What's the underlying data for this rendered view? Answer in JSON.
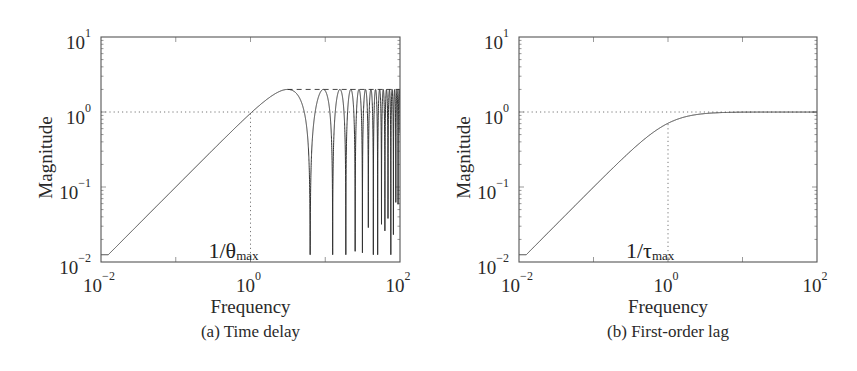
{
  "figure": {
    "width": 857,
    "height": 371,
    "line_color": "#333333",
    "frame_color": "#555555",
    "guide_color": "#777777"
  },
  "chart_data": [
    {
      "id": "a",
      "type": "line",
      "title": "",
      "caption": "(a) Time delay",
      "xlabel": "Frequency",
      "ylabel": "Magnitude",
      "xscale": "log",
      "yscale": "log",
      "xlim": [
        0.01,
        100
      ],
      "ylim": [
        0.01,
        10
      ],
      "xticks": [
        {
          "base": "10",
          "exp": "−2",
          "value": 0.01
        },
        {
          "base": "10",
          "exp": "0",
          "value": 1
        },
        {
          "base": "10",
          "exp": "2",
          "value": 100
        }
      ],
      "yticks": [
        {
          "base": "10",
          "exp": "−2",
          "value": 0.01
        },
        {
          "base": "10",
          "exp": "−1",
          "value": 0.1
        },
        {
          "base": "10",
          "exp": "0",
          "value": 1
        },
        {
          "base": "10",
          "exp": "1",
          "value": 10
        }
      ],
      "annotation": {
        "text": "1/θ",
        "sub": "max",
        "x": 1
      },
      "guides": {
        "hline_y": 1,
        "vline_x": 1
      },
      "series": [
        {
          "name": "|1 - e^{-jωθ}|",
          "model": "time_delay",
          "theta": 1,
          "description": "Rises with slope +1 from 0.01 at ω=0.01, crosses ~1 at ω=1, peaks at 2 near ω=π, then oscillates between 2 and deep notches at ω=2πk",
          "x": [
            0.01,
            0.1,
            0.5,
            1,
            2,
            3.14,
            5,
            6.28,
            8,
            9.42,
            12.57,
            15.7,
            18.85,
            31.4,
            62.8,
            100
          ],
          "y": [
            0.01,
            0.1,
            0.495,
            0.959,
            1.683,
            2.0,
            1.197,
            0.02,
            1.514,
            2.0,
            0.013,
            2.0,
            0.013,
            0.02,
            0.05,
            1.0
          ]
        }
      ],
      "envelope_dashed": {
        "y": 2,
        "x_from": 3.14,
        "x_to": 100
      }
    },
    {
      "id": "b",
      "type": "line",
      "title": "",
      "caption": "(b) First-order lag",
      "xlabel": "Frequency",
      "ylabel": "Magnitude",
      "xscale": "log",
      "yscale": "log",
      "xlim": [
        0.01,
        100
      ],
      "ylim": [
        0.01,
        10
      ],
      "xticks": [
        {
          "base": "10",
          "exp": "−2",
          "value": 0.01
        },
        {
          "base": "10",
          "exp": "0",
          "value": 1
        },
        {
          "base": "10",
          "exp": "2",
          "value": 100
        }
      ],
      "yticks": [
        {
          "base": "10",
          "exp": "−2",
          "value": 0.01
        },
        {
          "base": "10",
          "exp": "−1",
          "value": 0.1
        },
        {
          "base": "10",
          "exp": "0",
          "value": 1
        },
        {
          "base": "10",
          "exp": "1",
          "value": 10
        }
      ],
      "annotation": {
        "text": "1/τ",
        "sub": "max",
        "x": 1
      },
      "guides": {
        "hline_y": 1,
        "vline_x": 1
      },
      "series": [
        {
          "name": "|jωτ / (1 + jωτ)|",
          "model": "first_order_lag",
          "tau": 1,
          "description": "Rises with slope +1 from 0.01 at ω=0.01, corner at ω=1 (~0.707), flattens to 1 for high frequency",
          "x": [
            0.01,
            0.1,
            0.3,
            1,
            2,
            5,
            10,
            100
          ],
          "y": [
            0.01,
            0.0995,
            0.287,
            0.707,
            0.894,
            0.981,
            0.995,
            1.0
          ]
        }
      ]
    }
  ],
  "panels_layout": [
    {
      "id": "a",
      "box": {
        "x": 101,
        "y": 37,
        "w": 299,
        "h": 225
      },
      "ylabel_x": 52,
      "caption_y": 337,
      "xlabel_y": 313
    },
    {
      "id": "b",
      "box": {
        "x": 519,
        "y": 37,
        "w": 298,
        "h": 225
      },
      "ylabel_x": 470,
      "caption_y": 337,
      "xlabel_y": 313
    }
  ]
}
